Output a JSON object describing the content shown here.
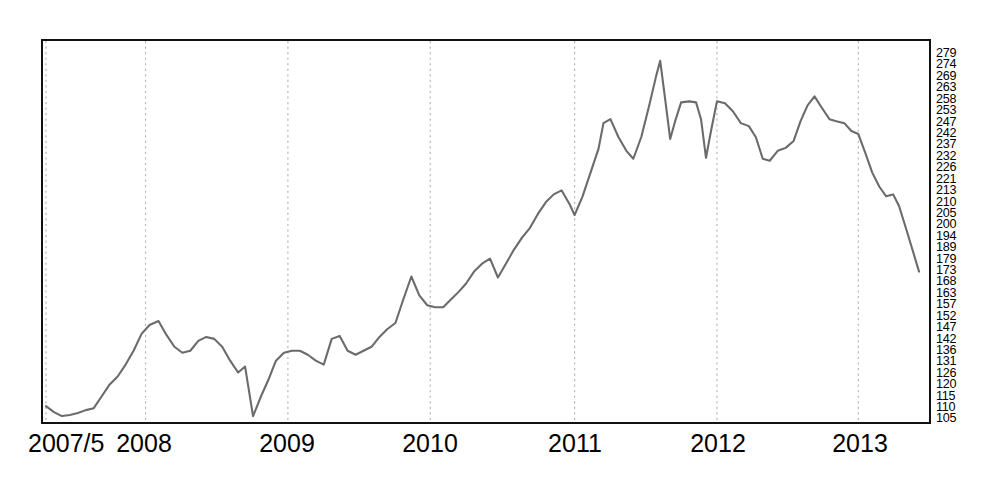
{
  "chart_data": {
    "type": "line",
    "title": "",
    "subtitle": "",
    "xlabel": "",
    "ylabel": "",
    "grid": "vertical-dotted-yearly",
    "legend": "none",
    "line_color": "#6b6b6b",
    "axis_color": "#111111",
    "gridline_color": "#b8b8b8",
    "background": "#ffffff",
    "xlim_labels": [
      "2007/5",
      "2013/8"
    ],
    "ylim": [
      105,
      279
    ],
    "x_tick_labels": [
      "2007/5",
      "2008",
      "2009",
      "2010",
      "2011",
      "2012",
      "2013"
    ],
    "x_tick_positions_px": [
      44,
      144,
      287,
      430,
      575,
      718,
      860
    ],
    "y_tick_labels": [
      "279",
      "274",
      "269",
      "263",
      "258",
      "253",
      "247",
      "242",
      "237",
      "232",
      "226",
      "221",
      "213",
      "210",
      "205",
      "200",
      "194",
      "189",
      "179",
      "173",
      "168",
      "163",
      "157",
      "152",
      "147",
      "142",
      "136",
      "131",
      "126",
      "120",
      "115",
      "110",
      "105"
    ],
    "y_tick_values": [
      279,
      274,
      269,
      263,
      258,
      253,
      247,
      242,
      237,
      232,
      226,
      221,
      213,
      210,
      205,
      200,
      194,
      189,
      179,
      173,
      168,
      163,
      157,
      152,
      147,
      142,
      136,
      131,
      126,
      120,
      115,
      110,
      105
    ],
    "y_tick_positions_px": [
      53,
      64.4,
      75.8,
      87.3,
      98.7,
      110.1,
      121.5,
      132.9,
      144.4,
      155.8,
      167.2,
      178.6,
      190,
      201.5,
      212.9,
      224.3,
      235.7,
      247.1,
      258.6,
      270,
      281.4,
      292.8,
      304.2,
      315.7,
      327.1,
      338.5,
      349.9,
      361.3,
      372.8,
      384.2,
      395.6,
      407,
      418.4
    ],
    "series": [
      {
        "name": "index",
        "points_px": [
          [
            44,
            408
          ],
          [
            52,
            414
          ],
          [
            60,
            418
          ],
          [
            68,
            417
          ],
          [
            76,
            415
          ],
          [
            84,
            412
          ],
          [
            92,
            410
          ],
          [
            100,
            398
          ],
          [
            108,
            386
          ],
          [
            116,
            378
          ],
          [
            124,
            366
          ],
          [
            132,
            352
          ],
          [
            140,
            335
          ],
          [
            148,
            326
          ],
          [
            157,
            322
          ],
          [
            165,
            336
          ],
          [
            173,
            348
          ],
          [
            181,
            354
          ],
          [
            189,
            352
          ],
          [
            197,
            342
          ],
          [
            205,
            338
          ],
          [
            213,
            340
          ],
          [
            221,
            348
          ],
          [
            229,
            362
          ],
          [
            237,
            374
          ],
          [
            244,
            368
          ],
          [
            252,
            418
          ],
          [
            260,
            398
          ],
          [
            268,
            380
          ],
          [
            275,
            362
          ],
          [
            283,
            354
          ],
          [
            291,
            352
          ],
          [
            299,
            352
          ],
          [
            307,
            356
          ],
          [
            315,
            362
          ],
          [
            323,
            366
          ],
          [
            331,
            340
          ],
          [
            339,
            337
          ],
          [
            347,
            352
          ],
          [
            355,
            356
          ],
          [
            363,
            352
          ],
          [
            371,
            348
          ],
          [
            379,
            338
          ],
          [
            387,
            330
          ],
          [
            395,
            324
          ],
          [
            403,
            300
          ],
          [
            411,
            277
          ],
          [
            419,
            296
          ],
          [
            427,
            306
          ],
          [
            435,
            308
          ],
          [
            443,
            308
          ],
          [
            451,
            300
          ],
          [
            459,
            292
          ],
          [
            466,
            284
          ],
          [
            474,
            272
          ],
          [
            482,
            264
          ],
          [
            490,
            259
          ],
          [
            498,
            278
          ],
          [
            506,
            264
          ],
          [
            514,
            250
          ],
          [
            522,
            238
          ],
          [
            530,
            228
          ],
          [
            538,
            214
          ],
          [
            546,
            202
          ],
          [
            554,
            194
          ],
          [
            562,
            190
          ],
          [
            570,
            204
          ],
          [
            575,
            215
          ],
          [
            583,
            196
          ],
          [
            591,
            172
          ],
          [
            599,
            148
          ],
          [
            604,
            122
          ],
          [
            611,
            118
          ],
          [
            619,
            136
          ],
          [
            627,
            150
          ],
          [
            634,
            158
          ],
          [
            642,
            136
          ],
          [
            650,
            104
          ],
          [
            657,
            74
          ],
          [
            661,
            59
          ],
          [
            666,
            98
          ],
          [
            671,
            138
          ],
          [
            676,
            120
          ],
          [
            682,
            101
          ],
          [
            690,
            100
          ],
          [
            697,
            101
          ],
          [
            702,
            118
          ],
          [
            707,
            157
          ],
          [
            712,
            130
          ],
          [
            718,
            100
          ],
          [
            726,
            102
          ],
          [
            734,
            110
          ],
          [
            742,
            122
          ],
          [
            750,
            125
          ],
          [
            757,
            136
          ],
          [
            764,
            158
          ],
          [
            771,
            160
          ],
          [
            779,
            150
          ],
          [
            787,
            147
          ],
          [
            795,
            140
          ],
          [
            802,
            120
          ],
          [
            809,
            104
          ],
          [
            816,
            95
          ],
          [
            823,
            106
          ],
          [
            831,
            118
          ],
          [
            838,
            120
          ],
          [
            846,
            122
          ],
          [
            853,
            130
          ],
          [
            860,
            133
          ],
          [
            867,
            152
          ],
          [
            874,
            172
          ],
          [
            881,
            186
          ],
          [
            888,
            196
          ],
          [
            895,
            194
          ],
          [
            901,
            206
          ],
          [
            909,
            232
          ],
          [
            915,
            252
          ],
          [
            921,
            272
          ]
        ],
        "approx_values": [
          113,
          111,
          110,
          110,
          111,
          112,
          113,
          118,
          123,
          127,
          133,
          139,
          147,
          151,
          153,
          147,
          142,
          139,
          140,
          145,
          147,
          146,
          142,
          136,
          131,
          134,
          110,
          118,
          126,
          134,
          138,
          139,
          139,
          137,
          134,
          133,
          145,
          146,
          139,
          137,
          139,
          141,
          146,
          150,
          153,
          165,
          177,
          166,
          161,
          160,
          160,
          165,
          169,
          173,
          179,
          184,
          187,
          177,
          184,
          192,
          198,
          203,
          210,
          218,
          223,
          226,
          218,
          213,
          222,
          236,
          248,
          260,
          263,
          254,
          247,
          242,
          254,
          270,
          284,
          292,
          271,
          252,
          262,
          272,
          273,
          272,
          262,
          243,
          257,
          272,
          271,
          267,
          261,
          259,
          254,
          243,
          242,
          247,
          249,
          253,
          263,
          272,
          277,
          271,
          264,
          258,
          257,
          253,
          251,
          242,
          232,
          225,
          220,
          221,
          215,
          202,
          192,
          182
        ]
      }
    ]
  },
  "axis": {
    "y_labels_position": "right-outside",
    "x_labels_position": "bottom-outside"
  }
}
